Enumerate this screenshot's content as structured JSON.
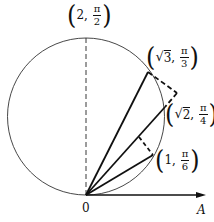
{
  "diagram": {
    "type": "polar-coordinate-geometry",
    "colors": {
      "stroke": "#111111",
      "background": "#ffffff"
    },
    "origin_label": "0",
    "axis_label": "A",
    "circle": {
      "description": "circle through origin with diameter 2 along the pi/2 ray"
    },
    "points": [
      {
        "id": "p_top",
        "r": "2",
        "theta_num": "π",
        "theta_den": "2",
        "has_sqrt": false
      },
      {
        "id": "p_sqrt3",
        "r": "3",
        "theta_num": "π",
        "theta_den": "3",
        "has_sqrt": true
      },
      {
        "id": "p_sqrt2",
        "r": "2",
        "theta_num": "π",
        "theta_den": "4",
        "has_sqrt": true
      },
      {
        "id": "p_one",
        "r": "1",
        "theta_num": "π",
        "theta_den": "6",
        "has_sqrt": false
      }
    ],
    "separator": ","
  }
}
